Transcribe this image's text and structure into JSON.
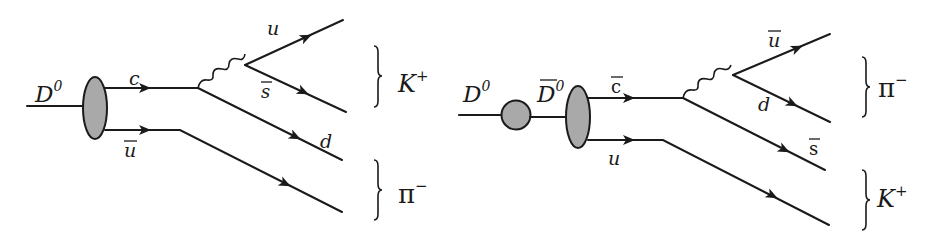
{
  "diagrams": [
    {
      "name": "direct-decay",
      "initial_state": {
        "label": "D",
        "sup": "0"
      },
      "quarks_in": [
        {
          "label": "c",
          "bar": false
        },
        {
          "label": "u",
          "bar": true
        }
      ],
      "boson": "W",
      "quarks_out": [
        {
          "label": "u",
          "bar": false
        },
        {
          "label": "s",
          "bar": true
        },
        {
          "label": "d",
          "bar": false
        }
      ],
      "final_states": [
        {
          "label": "K",
          "sup": "+"
        },
        {
          "label": "π",
          "sup": "−"
        }
      ]
    },
    {
      "name": "mixing-decay",
      "initial_state": {
        "label": "D",
        "sup": "0"
      },
      "intermediate_state": {
        "label": "D",
        "sup": "0",
        "bar": true
      },
      "quarks_in": [
        {
          "label": "c",
          "bar": true
        },
        {
          "label": "u",
          "bar": false
        }
      ],
      "boson": "W",
      "quarks_out": [
        {
          "label": "u",
          "bar": true
        },
        {
          "label": "d",
          "bar": false
        },
        {
          "label": "s",
          "bar": true
        }
      ],
      "final_states": [
        {
          "label": "π",
          "sup": "−"
        },
        {
          "label": "K",
          "sup": "+"
        }
      ]
    }
  ],
  "colors": {
    "line": "#1a1a1a",
    "blob_fill": "#a9a9a9",
    "background": "#ffffff"
  }
}
